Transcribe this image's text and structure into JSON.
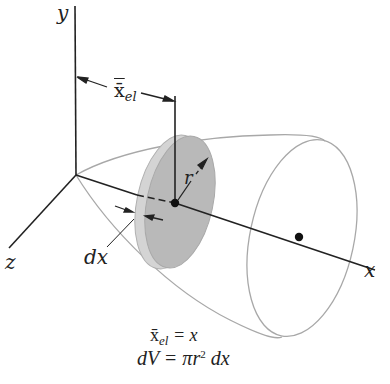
{
  "figure": {
    "type": "volume-of-revolution-disk-element",
    "axes": {
      "y_label": "y",
      "x_label": "x",
      "z_label": "z"
    },
    "dimension_labels": {
      "centroid_distance": "x̄",
      "centroid_distance_sub": "el",
      "radius": "r",
      "thickness": "dx"
    },
    "equations": {
      "line1_lhs": "x̄",
      "line1_sub": "el",
      "line1_rhs": " = x",
      "line2_lhs": "dV",
      "line2_mid": " = πr",
      "line2_sup": "2",
      "line2_rhs": " dx"
    },
    "colors": {
      "axis": "#222222",
      "outline": "#a8a8a8",
      "disk_face": "#b9b9b9",
      "disk_rim": "#d0d0d0",
      "point": "#111111"
    }
  }
}
